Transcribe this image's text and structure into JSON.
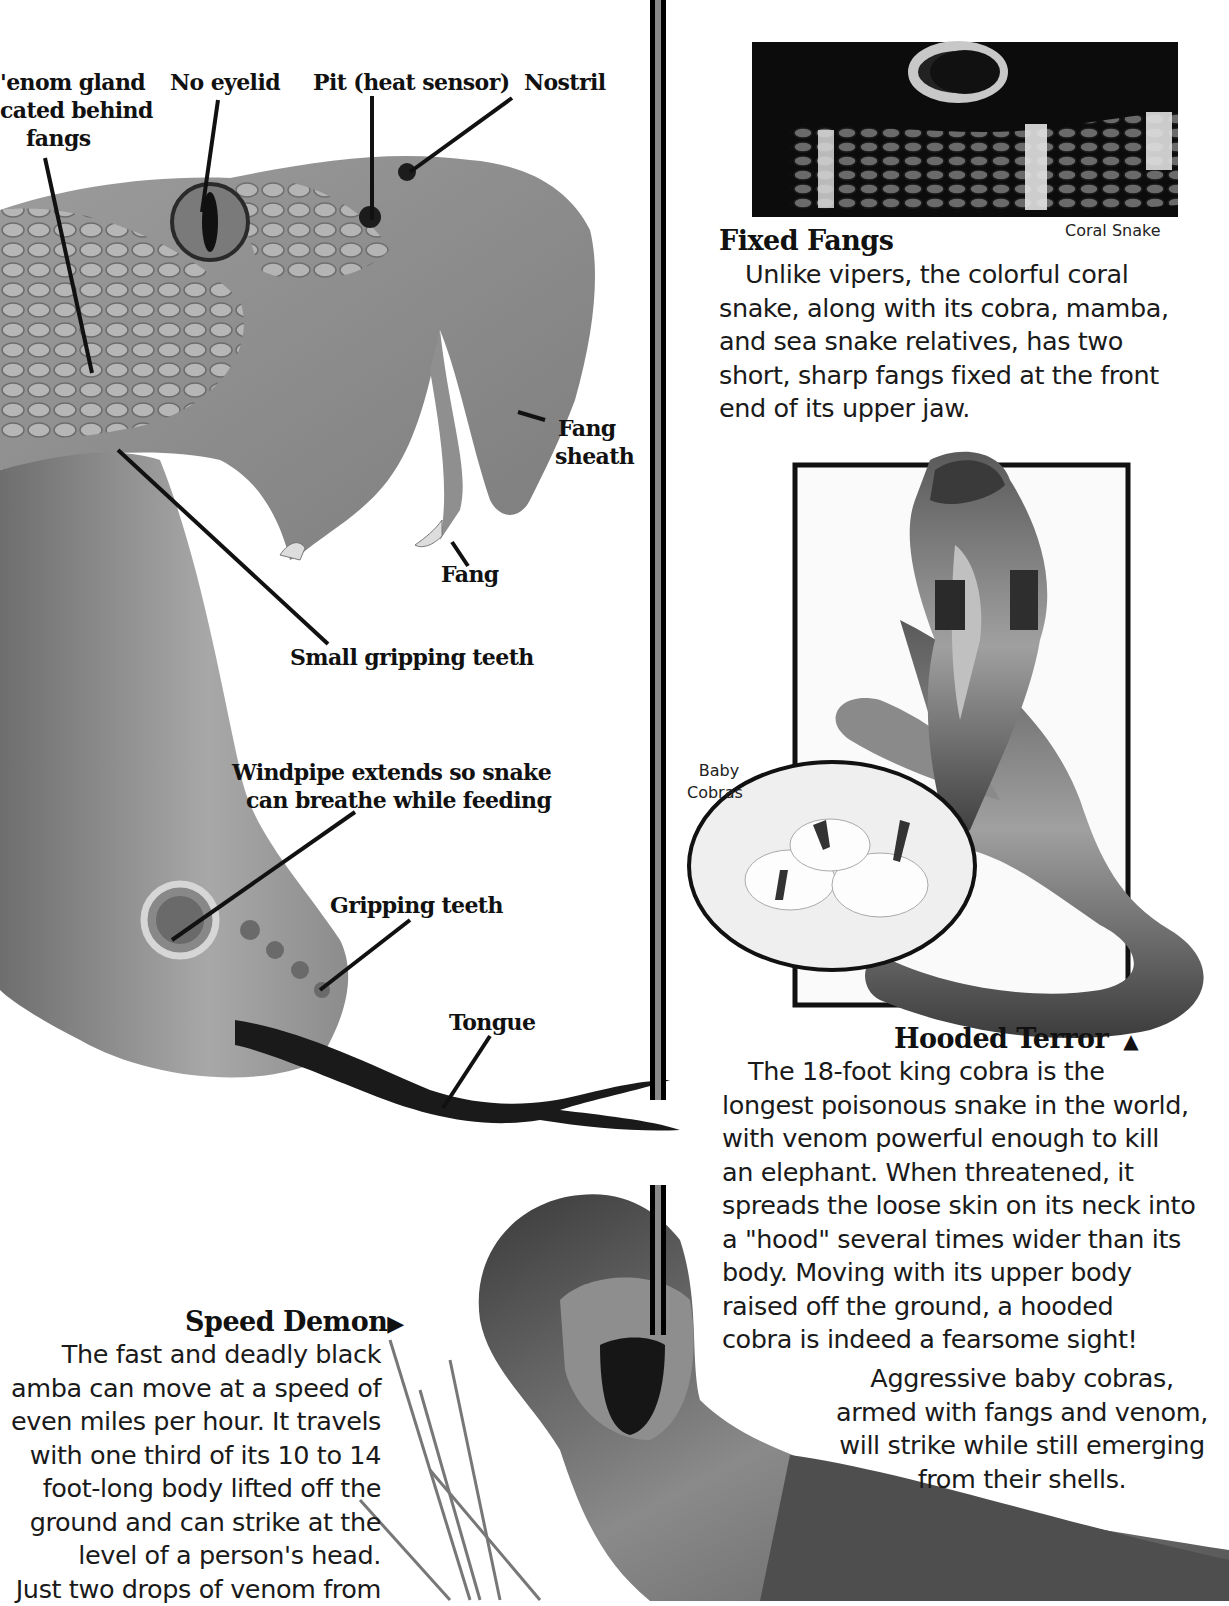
{
  "viper_diagram": {
    "labels": {
      "venom_gland": [
        "Venom gland",
        "located behind",
        "fangs"
      ],
      "venom_gland_visible": [
        "'enom gland",
        "cated behind",
        "fangs"
      ],
      "no_eyelid": "No eyelid",
      "pit": "Pit (heat sensor)",
      "nostril": "Nostril",
      "fang_sheath": [
        "Fang",
        "sheath"
      ],
      "fang": "Fang",
      "small_gripping_teeth": "Small gripping teeth",
      "windpipe": [
        "Windpipe extends so snake",
        "can breathe while feeding"
      ],
      "gripping_teeth": "Gripping teeth",
      "tongue": "Tongue"
    }
  },
  "fixed_fangs": {
    "photo_caption": "Coral Snake",
    "heading": "Fixed Fangs",
    "body_lines": [
      "Unlike vipers, the colorful coral",
      "snake, along with its cobra, mamba,",
      "and sea snake relatives, has two",
      "short, sharp fangs fixed at the front",
      "end of its upper jaw."
    ]
  },
  "hooded_terror": {
    "inset_label": [
      "Baby",
      "Cobras"
    ],
    "heading": "Hooded Terror",
    "heading_arrow": "▲",
    "body_lines": [
      "The 18-foot king cobra is the",
      "longest poisonous snake in the world,",
      "with venom powerful enough to kill",
      "an elephant. When threatened, it",
      "spreads the loose skin on its neck into",
      "a \"hood\" several times wider than its",
      "body. Moving with its upper body",
      "raised off the ground, a hooded",
      "cobra is indeed a fearsome sight!"
    ],
    "baby_caption_lines": [
      "Aggressive baby cobras,",
      "armed with fangs and venom,",
      "will strike while still emerging",
      "from their shells."
    ]
  },
  "speed_demon": {
    "heading": "Speed Demon",
    "heading_arrow": "▶",
    "body_lines": [
      "The fast and deadly black",
      "amba can move at a speed of",
      "even miles per hour. It travels",
      "with one third of its 10 to 14",
      "foot-long body lifted off the",
      "ground and can strike at the",
      "level of a person's head.",
      "Just two drops of venom from"
    ]
  },
  "colors": {
    "ink": "#111111",
    "divider_fill": "#8a8a8a",
    "divider_border": "#000000",
    "illustration_mid": "#9a9a9a",
    "illustration_dark": "#4a4a4a",
    "photo_bg": "#0c0c0c"
  }
}
